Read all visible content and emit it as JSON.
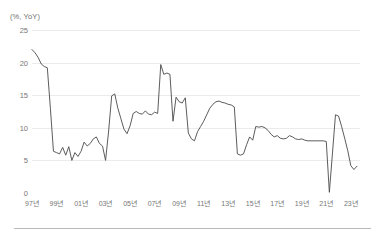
{
  "axis_title": "(%, YoY)",
  "chart_data": {
    "type": "line",
    "title": "",
    "subtitle": "",
    "xlabel": "",
    "ylabel": "(%, YoY)",
    "ylim": [
      0,
      25
    ],
    "xlim": [
      1997,
      2023.75
    ],
    "grid": true,
    "legend": null,
    "legend_position": "none",
    "line_color": "#4a4a4a",
    "grid_color": "#eceaea",
    "ytick_labels": [
      "25",
      "20",
      "15",
      "10",
      "5",
      "0"
    ],
    "ytick_values": [
      25,
      20,
      15,
      10,
      5,
      0
    ],
    "xtick_labels": [
      "97년",
      "99년",
      "01년",
      "03년",
      "05년",
      "07년",
      "09년",
      "11년",
      "13년",
      "15년",
      "17년",
      "19년",
      "21년",
      "23년"
    ],
    "xtick_values": [
      1997,
      1999,
      2001,
      2003,
      2005,
      2007,
      2009,
      2011,
      2013,
      2015,
      2017,
      2019,
      2021,
      2023
    ],
    "series": [
      {
        "name": "",
        "x": [
          1997.0,
          1997.25,
          1997.5,
          1997.75,
          1998.0,
          1998.25,
          1998.5,
          1998.75,
          1999.0,
          1999.25,
          1999.5,
          1999.75,
          2000.0,
          2000.25,
          2000.5,
          2000.75,
          2001.0,
          2001.25,
          2001.5,
          2001.75,
          2002.0,
          2002.25,
          2002.5,
          2002.75,
          2003.0,
          2003.25,
          2003.5,
          2003.75,
          2004.0,
          2004.25,
          2004.5,
          2004.75,
          2005.0,
          2005.25,
          2005.5,
          2005.75,
          2006.0,
          2006.25,
          2006.5,
          2006.75,
          2007.0,
          2007.25,
          2007.5,
          2007.75,
          2008.0,
          2008.25,
          2008.5,
          2008.75,
          2009.0,
          2009.25,
          2009.5,
          2009.75,
          2010.0,
          2010.25,
          2010.5,
          2010.75,
          2011.0,
          2011.25,
          2011.5,
          2011.75,
          2012.0,
          2012.25,
          2012.5,
          2012.75,
          2013.0,
          2013.25,
          2013.5,
          2013.75,
          2014.0,
          2014.25,
          2014.5,
          2014.75,
          2015.0,
          2015.25,
          2015.5,
          2015.75,
          2016.0,
          2016.25,
          2016.5,
          2016.75,
          2017.0,
          2017.25,
          2017.5,
          2017.75,
          2018.0,
          2018.25,
          2018.5,
          2018.75,
          2019.0,
          2019.25,
          2019.5,
          2019.75,
          2020.0,
          2020.25,
          2020.5,
          2020.75,
          2021.0,
          2021.25,
          2021.5,
          2021.75,
          2022.0,
          2022.25,
          2022.5,
          2022.75,
          2023.0,
          2023.25,
          2023.5
        ],
        "values": [
          22.0,
          21.5,
          20.8,
          19.8,
          19.4,
          19.2,
          13.0,
          6.4,
          6.2,
          6.0,
          7.0,
          5.8,
          7.1,
          5.0,
          6.2,
          5.6,
          6.4,
          7.8,
          7.2,
          7.6,
          8.3,
          8.6,
          7.6,
          7.2,
          5.0,
          9.5,
          14.9,
          15.2,
          13.0,
          11.4,
          9.8,
          9.1,
          10.3,
          12.2,
          12.5,
          12.2,
          12.1,
          12.6,
          12.1,
          12.0,
          12.4,
          12.2,
          19.7,
          18.2,
          18.4,
          18.2,
          11.0,
          14.7,
          14.0,
          13.8,
          14.6,
          9.2,
          8.3,
          8.0,
          9.4,
          10.2,
          11.0,
          12.0,
          13.0,
          13.6,
          14.0,
          14.1,
          13.9,
          13.8,
          13.6,
          13.5,
          13.2,
          6.0,
          5.8,
          6.0,
          7.4,
          8.6,
          8.1,
          10.2,
          10.1,
          10.2,
          10.0,
          9.6,
          9.0,
          8.6,
          8.8,
          8.4,
          8.3,
          8.4,
          8.8,
          8.6,
          8.3,
          8.2,
          8.3,
          8.1,
          8.0,
          8.0,
          8.0,
          8.0,
          8.0,
          8.0,
          7.9,
          0.1,
          6.0,
          12.0,
          11.8,
          10.2,
          8.4,
          6.5,
          4.2,
          3.6,
          4.1
        ]
      }
    ]
  }
}
